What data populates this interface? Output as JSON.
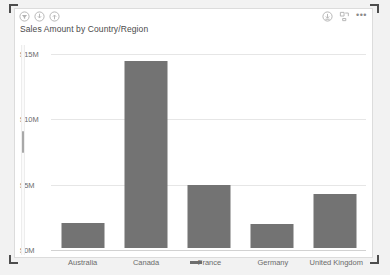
{
  "visual": {
    "title": "Sales Amount by Country/Region",
    "header": {
      "left_icons": [
        {
          "name": "filter-icon",
          "glyph": "filter"
        },
        {
          "name": "drill-down-icon",
          "glyph": "drill-down"
        },
        {
          "name": "drill-up-icon",
          "glyph": "drill-up"
        }
      ],
      "right_icons": [
        {
          "name": "expand-hierarchy-icon",
          "glyph": "expand-down"
        },
        {
          "name": "focus-mode-icon",
          "glyph": "focus"
        },
        {
          "name": "more-options-icon",
          "glyph": "..."
        }
      ],
      "more_options_label": "•••"
    }
  },
  "scrollbar": {
    "name": "page-scrollbar",
    "orientation": "vertical"
  },
  "selection": {
    "corners": [
      "top-left",
      "top-right",
      "bottom-left",
      "bottom-right"
    ],
    "handles": [
      "top-center",
      "bottom-center"
    ],
    "color": "#4d4d4d"
  },
  "chart_data": {
    "type": "bar",
    "title": "Sales Amount by Country/Region",
    "xlabel": "",
    "ylabel": "",
    "categories": [
      "Australia",
      "Canada",
      "France",
      "Germany",
      "United Kingdom"
    ],
    "values": [
      1.9,
      14.3,
      4.8,
      1.8,
      4.1
    ],
    "value_unit": "M",
    "value_prefix": "$",
    "ylim": [
      0,
      15
    ],
    "yticks": [
      0,
      5,
      10,
      15
    ],
    "ytick_labels": [
      "$0M",
      "$5M",
      "$10M",
      "$15M"
    ],
    "grid": true,
    "legend": false,
    "bar_color": "#737373",
    "gridline_color": "#e6e6e6",
    "axis_text_color": "#6b6b6b"
  }
}
